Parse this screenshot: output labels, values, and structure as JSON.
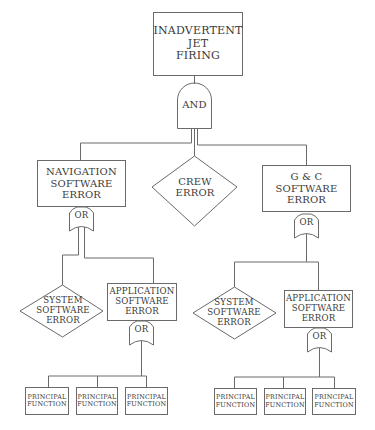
{
  "diagram": {
    "type": "fault-tree",
    "colors": {
      "line": "#6a6a6a",
      "text": "#3a3a3a",
      "background": "#ffffff"
    },
    "top_event": {
      "lines": [
        "INADVERTENT",
        "JET",
        "FIRING"
      ]
    },
    "top_gate": {
      "type": "AND",
      "label": "AND"
    },
    "level1": {
      "navigation": {
        "lines": [
          "NAVIGATION",
          "SOFTWARE",
          "ERROR"
        ],
        "gate": "OR"
      },
      "crew": {
        "lines": [
          "CREW",
          "ERROR"
        ],
        "shape": "diamond"
      },
      "gnc": {
        "lines": [
          "G & C",
          "SOFTWARE",
          "ERROR"
        ],
        "gate": "OR"
      }
    },
    "left_branch": {
      "system": {
        "lines": [
          "SYSTEM",
          "SOFTWARE",
          "ERROR"
        ],
        "shape": "diamond"
      },
      "application": {
        "lines": [
          "APPLICATION",
          "SOFTWARE",
          "ERROR"
        ],
        "gate": "OR"
      },
      "functions": [
        {
          "lines": [
            "PRINCIPAL",
            "FUNCTION"
          ]
        },
        {
          "lines": [
            "PRINCIPAL",
            "FUNCTION"
          ]
        },
        {
          "lines": [
            "PRINCIPAL",
            "FUNCTION"
          ]
        }
      ]
    },
    "right_branch": {
      "system": {
        "lines": [
          "SYSTEM",
          "SOFTWARE",
          "ERROR"
        ],
        "shape": "diamond"
      },
      "application": {
        "lines": [
          "APPLICATION",
          "SOFTWARE",
          "ERROR"
        ],
        "gate": "OR"
      },
      "functions": [
        {
          "lines": [
            "PRINCIPAL",
            "FUNCTION"
          ]
        },
        {
          "lines": [
            "PRINCIPAL",
            "FUNCTION"
          ]
        },
        {
          "lines": [
            "PRINCIPAL",
            "FUNCTION"
          ]
        }
      ]
    }
  }
}
